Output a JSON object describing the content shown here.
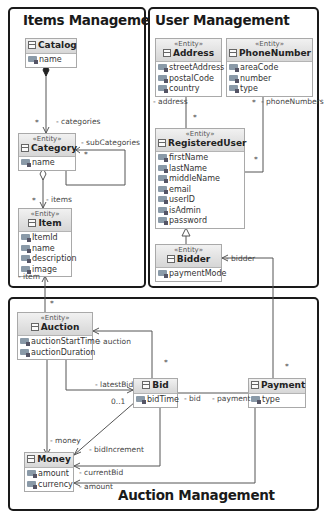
{
  "packages": {
    "items": {
      "title": "Items Management"
    },
    "users": {
      "title": "User Management"
    },
    "auction": {
      "title": "Auction Management"
    }
  },
  "classes": {
    "catalog": {
      "stereotype": "",
      "name": "Catalog",
      "attributes": [
        "name"
      ]
    },
    "category": {
      "stereotype": "«Entity»",
      "name": "Category",
      "attributes": [
        "name"
      ]
    },
    "item": {
      "stereotype": "«Entity»",
      "name": "Item",
      "attributes": [
        "ItemId",
        "name",
        "description",
        "image"
      ]
    },
    "address": {
      "stereotype": "«Entity»",
      "name": "Address",
      "attributes": [
        "streetAddress",
        "postalCode",
        "country"
      ]
    },
    "phoneNumber": {
      "stereotype": "«Entity»",
      "name": "PhoneNumber",
      "attributes": [
        "areaCode",
        "number",
        "type"
      ]
    },
    "registeredUser": {
      "stereotype": "«Entity»",
      "name": "RegisteredUser",
      "attributes": [
        "firstName",
        "lastName",
        "middleName",
        "email",
        "userID",
        "isAdmin",
        "password"
      ]
    },
    "bidder": {
      "stereotype": "«Entity»",
      "name": "Bidder",
      "attributes": [
        "paymentMode"
      ]
    },
    "auction": {
      "stereotype": "«Entity»",
      "name": "Auction",
      "attributes": [
        "auctionStartTime",
        "auctionDuration"
      ]
    },
    "bid": {
      "stereotype": "",
      "name": "Bid",
      "attributes": [
        "bidTime"
      ]
    },
    "payment": {
      "stereotype": "",
      "name": "Payment",
      "attributes": [
        "type"
      ]
    },
    "money": {
      "stereotype": "",
      "name": "Money",
      "attributes": [
        "amount",
        "currency"
      ]
    }
  },
  "labels": {
    "categories": "- categories",
    "categoriesMult": "*",
    "subCategories": "- subCategories",
    "subCategoriesMult": "*",
    "items": "- items",
    "itemsMult": "*",
    "item": "- item",
    "itemMult": "*",
    "address": "- address",
    "addressMult": "*",
    "phoneNumbers": "- phoneNumbers",
    "phoneNumbersMult": "*",
    "regUserMult": "*",
    "bidder": "- bidder",
    "auctionRole": "- auction",
    "auctionMult": "*",
    "latestBid": "- latestBid",
    "latestBidMult": "0..1",
    "bid": "- bid",
    "payment": "- payment",
    "paymentMult": "*",
    "money": "- money",
    "bidIncrement": "- bidIncrement",
    "currentBid": "- currentBid",
    "amount": "- amount"
  }
}
